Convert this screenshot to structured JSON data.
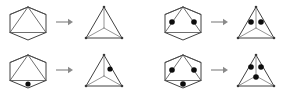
{
  "figure": {
    "background_color": "#ffffff",
    "canvas": {
      "width": 284,
      "height": 97
    },
    "colors": {
      "outline": "#2b2b2b",
      "chord": "#4a4a4a",
      "spoke": "#7a7a7a",
      "dot": "#0d0d0d",
      "arrow": "#8a8a8a"
    },
    "panels": [
      {
        "id": "panel-top-left",
        "position": "top-left",
        "dot_count": 0,
        "source": {
          "shape": "hexagon",
          "label": "hexagon",
          "dots": [],
          "dot_count": 0
        },
        "arrow": {
          "symbol": "→",
          "direction": "right"
        },
        "target": {
          "shape": "triangle",
          "label": "triangle",
          "dots": [],
          "dot_count": 0
        }
      },
      {
        "id": "panel-top-right",
        "position": "top-right",
        "dot_count": 2,
        "source": {
          "shape": "hexagon",
          "label": "hexagon",
          "dots": [
            "upper-left",
            "upper-right"
          ],
          "dot_count": 2
        },
        "arrow": {
          "symbol": "→",
          "direction": "right"
        },
        "target": {
          "shape": "triangle",
          "label": "triangle",
          "dots": [
            "center-left",
            "center-right"
          ],
          "dot_count": 2
        }
      },
      {
        "id": "panel-bottom-left",
        "position": "bottom-left",
        "dot_count": 1,
        "source": {
          "shape": "hexagon",
          "label": "hexagon",
          "dots": [
            "bottom-center"
          ],
          "dot_count": 1
        },
        "arrow": {
          "symbol": "→",
          "direction": "right"
        },
        "target": {
          "shape": "triangle",
          "label": "triangle",
          "dots": [
            "center-right"
          ],
          "dot_count": 1
        }
      },
      {
        "id": "panel-bottom-right",
        "position": "bottom-right",
        "dot_count": 3,
        "source": {
          "shape": "hexagon",
          "label": "hexagon",
          "dots": [
            "upper-left",
            "upper-right",
            "bottom-center"
          ],
          "dot_count": 3
        },
        "arrow": {
          "symbol": "→",
          "direction": "right"
        },
        "target": {
          "shape": "triangle",
          "label": "triangle",
          "dots": [
            "center-left",
            "center-right",
            "below-center"
          ],
          "dot_count": 3
        }
      }
    ]
  }
}
